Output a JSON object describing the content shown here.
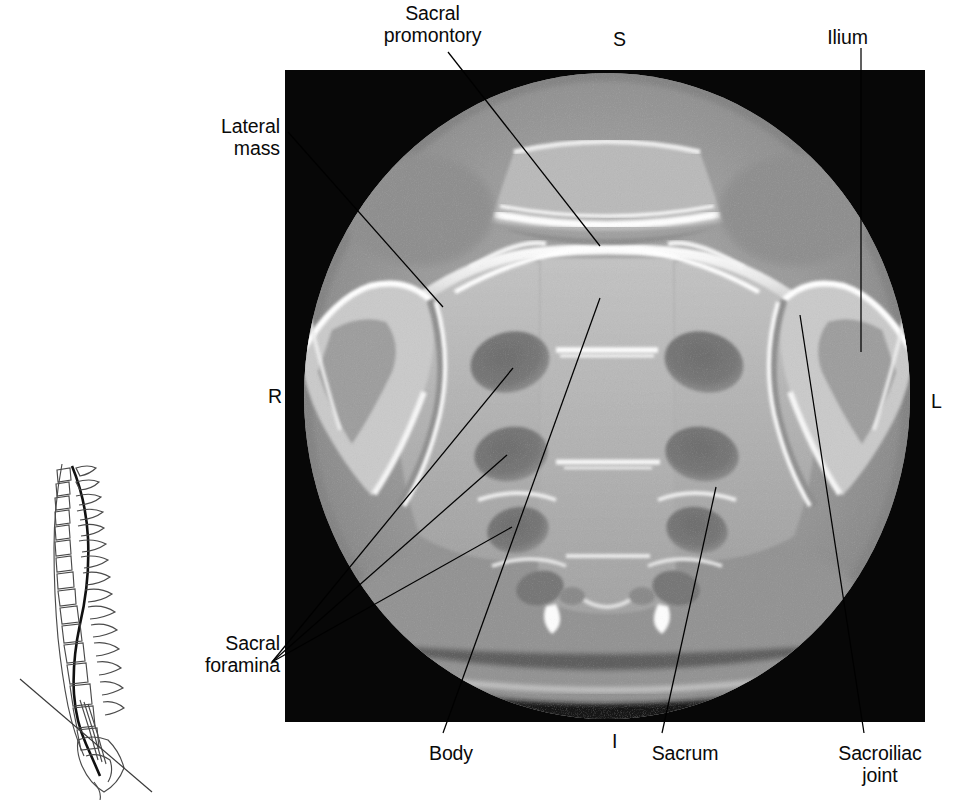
{
  "figure": {
    "type": "annotated-ct-scan",
    "modality": "CT",
    "plane": "axial",
    "region": "sacrum",
    "panel": {
      "x": 285,
      "y": 70,
      "width": 640,
      "height": 652,
      "background": "#070707"
    }
  },
  "orientation_markers": [
    {
      "name": "superior",
      "text": "S",
      "x": 613,
      "y": 28
    },
    {
      "name": "right",
      "text": "R",
      "x": 268,
      "y": 385
    },
    {
      "name": "left",
      "text": "L",
      "x": 931,
      "y": 390
    },
    {
      "name": "inferior",
      "text": "I",
      "x": 612,
      "y": 730
    }
  ],
  "labels": [
    {
      "name": "sacral-promontory",
      "lines": [
        "Sacral",
        "promontory"
      ],
      "align": "center",
      "x": 345,
      "y": 2,
      "width": 175
    },
    {
      "name": "lateral-mass",
      "lines": [
        "Lateral",
        "mass"
      ],
      "align": "right",
      "x": 105,
      "y": 115,
      "width": 175
    },
    {
      "name": "ilium",
      "lines": [
        "Ilium"
      ],
      "align": "center",
      "x": 790,
      "y": 26,
      "width": 115
    },
    {
      "name": "sacral-foramina",
      "lines": [
        "Sacral",
        "foramina"
      ],
      "align": "right",
      "x": 30,
      "y": 632,
      "width": 250
    },
    {
      "name": "body",
      "lines": [
        "Body"
      ],
      "align": "center",
      "x": 396,
      "y": 742,
      "width": 110
    },
    {
      "name": "sacrum",
      "lines": [
        "Sacrum"
      ],
      "align": "center",
      "x": 620,
      "y": 742,
      "width": 130
    },
    {
      "name": "sacroiliac-joint",
      "lines": [
        "Sacroiliac",
        "joint"
      ],
      "align": "center",
      "x": 805,
      "y": 742,
      "width": 150
    }
  ],
  "leader_lines": [
    {
      "name": "leader-sacral-promontory",
      "from": [
        448,
        52
      ],
      "to": [
        600,
        246
      ]
    },
    {
      "name": "leader-lateral-mass",
      "from": [
        288,
        132
      ],
      "to": [
        443,
        307
      ]
    },
    {
      "name": "leader-ilium",
      "from": [
        861,
        48
      ],
      "to": [
        861,
        352
      ]
    },
    {
      "name": "leader-sacral-foramina-1",
      "from": [
        272,
        662
      ],
      "to": [
        513,
        368
      ]
    },
    {
      "name": "leader-sacral-foramina-2",
      "from": [
        272,
        662
      ],
      "to": [
        507,
        455
      ]
    },
    {
      "name": "leader-sacral-foramina-3",
      "from": [
        272,
        662
      ],
      "to": [
        512,
        527
      ]
    },
    {
      "name": "leader-body",
      "from": [
        443,
        733
      ],
      "to": [
        600,
        298
      ]
    },
    {
      "name": "leader-sacrum",
      "from": [
        662,
        733
      ],
      "to": [
        716,
        487
      ]
    },
    {
      "name": "leader-sacroiliac-joint",
      "from": [
        864,
        733
      ],
      "to": [
        800,
        315
      ]
    }
  ],
  "anatomy": {
    "sacral_foramina_count_visible": 8,
    "structures": [
      "sacral promontory",
      "lateral mass",
      "ilium",
      "sacral foramina",
      "body",
      "sacrum",
      "sacroiliac joint"
    ]
  },
  "spine_diagram": {
    "name": "lateral-spine-locator",
    "view": "lateral",
    "scan_plane_line": {
      "from": [
        20,
        679
      ],
      "to": [
        152,
        792
      ]
    },
    "bounds": {
      "x": 18,
      "y": 455,
      "width": 140,
      "height": 345
    }
  },
  "colors": {
    "panel_background": "#070707",
    "label_text": "#0a0a0a",
    "leader": "#000000",
    "bone_bright": "#f2f2f2",
    "soft_tissue": "#9a9a9a"
  }
}
